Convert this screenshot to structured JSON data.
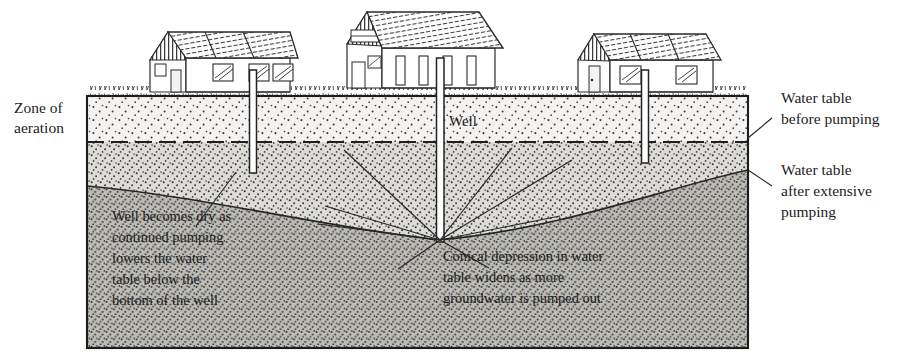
{
  "figure": {
    "type": "geology-cross-section"
  },
  "labels": {
    "zone_of_aeration": {
      "line1": "Zone of",
      "line2": "aeration"
    },
    "well": "Well",
    "water_table_before": {
      "line1": "Water table",
      "line2": "before pumping"
    },
    "water_table_after": {
      "line1": "Water table",
      "line2": "after extensive",
      "line3": "pumping"
    },
    "dry_well_callout": {
      "line1": "Well becomes dry as",
      "line2": "continued pumping",
      "line3": "lowers the water",
      "line4": "table below the",
      "line5": "bottom of the well"
    },
    "cone_callout": {
      "line1": "Conical depression in water",
      "line2": "table widens as more",
      "line3": "groundwater is pumped out"
    }
  },
  "structures": {
    "houses": [
      {
        "name": "house-left",
        "x": 150,
        "y": 30
      },
      {
        "name": "house-center",
        "x": 350,
        "y": 8
      },
      {
        "name": "house-right",
        "x": 578,
        "y": 32
      }
    ],
    "wells": [
      {
        "name": "well-left",
        "x": 253,
        "top": 90,
        "bottom": 173,
        "status": "dry"
      },
      {
        "name": "well-center",
        "x": 440,
        "top": 80,
        "bottom": 242,
        "status": "pumping"
      },
      {
        "name": "well-right",
        "x": 645,
        "top": 92,
        "bottom": 163,
        "status": "dry"
      }
    ]
  },
  "colors": {
    "zone_of_aeration": "#f2f1ef",
    "saturated_upper": "#d6d5d1",
    "saturated_lower": "#b9b8b3",
    "outline": "#2b2b2b",
    "stipple": "#2f2f2f",
    "paper": "#ffffff"
  },
  "geometry": {
    "block": {
      "left": 87,
      "top": 96,
      "right": 748,
      "bottom": 348
    },
    "water_table_before_y": 142,
    "cone_apex": {
      "x": 440,
      "y": 240
    },
    "cone_rim_left_y": 186,
    "cone_rim_right_y": 170
  }
}
